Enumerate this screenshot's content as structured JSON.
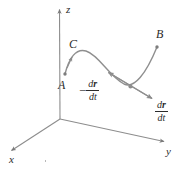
{
  "figure": {
    "type": "vector-calculus-diagram",
    "stroke_color": "#808080",
    "text_color": "#2b2b2b",
    "background": "#ffffff"
  },
  "axes": {
    "x_label": "x",
    "y_label": "y",
    "z_label": "z",
    "origin": {
      "x": 60,
      "y": 119
    }
  },
  "points": [
    {
      "id": "A",
      "label": "A",
      "x": 65,
      "y": 74
    },
    {
      "id": "B",
      "label": "B",
      "x": 157,
      "y": 47
    },
    {
      "id": "C",
      "label": "C",
      "x": 73,
      "y": 44
    }
  ],
  "vectors": {
    "positive": {
      "numerator_d": "d",
      "numerator_r": "r",
      "denominator_d": "d",
      "denominator_t": "t",
      "sign": ""
    },
    "negative": {
      "numerator_d": "d",
      "numerator_r": "r",
      "denominator_d": "d",
      "denominator_t": "t",
      "sign": "−"
    }
  },
  "curve": {
    "name": "C",
    "path": "M 65,74 C 69,58 76,48 86,51 C 99,55 108,75 124,84 C 134,89 146,74 157,47"
  }
}
